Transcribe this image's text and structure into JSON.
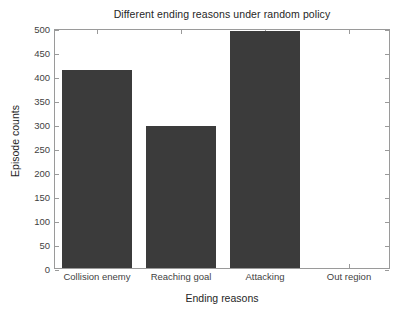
{
  "chart_data": {
    "type": "bar",
    "title": "Different ending reasons under random policy",
    "xlabel": "Ending reasons",
    "ylabel": "Episode counts",
    "categories": [
      "Collision enemy",
      "Reaching goal",
      "Attacking",
      "Out region"
    ],
    "values": [
      412,
      296,
      493,
      0
    ],
    "ylim": [
      0,
      500
    ],
    "yticks": [
      0,
      50,
      100,
      150,
      200,
      250,
      300,
      350,
      400,
      450,
      500
    ],
    "ytick_labels": [
      "0",
      "50",
      "100",
      "150",
      "200",
      "250",
      "300",
      "350",
      "400",
      "450",
      "500"
    ],
    "grid": false,
    "legend": null,
    "series": [
      {
        "name": "Episode counts",
        "values": [
          412,
          296,
          493,
          0
        ],
        "color": "#3b3b3b"
      }
    ],
    "colors": {
      "bar": "#3b3b3b",
      "axis": "#9a9a9a",
      "text": "#262626",
      "tick_text": "#3f3f3f",
      "background": "#ffffff"
    }
  }
}
